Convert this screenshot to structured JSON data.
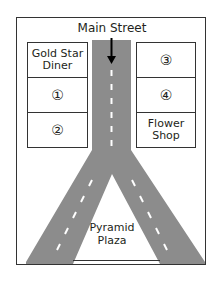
{
  "map": {
    "street_label": "Main Street",
    "colors": {
      "road": "#8c8c8c",
      "border": "#333333",
      "dash": "#ffffff",
      "arrow": "#000000"
    },
    "left_column": [
      {
        "id": "gold-star-diner",
        "label_line1": "Gold Star",
        "label_line2": "Diner"
      },
      {
        "id": "lot-1",
        "label": "①"
      },
      {
        "id": "lot-2",
        "label": "②"
      }
    ],
    "right_column": [
      {
        "id": "lot-3",
        "label": "③"
      },
      {
        "id": "lot-4",
        "label": "④"
      },
      {
        "id": "flower-shop",
        "label_line1": "Flower",
        "label_line2": "Shop"
      }
    ],
    "plaza": {
      "label_line1": "Pyramid",
      "label_line2": "Plaza"
    }
  }
}
